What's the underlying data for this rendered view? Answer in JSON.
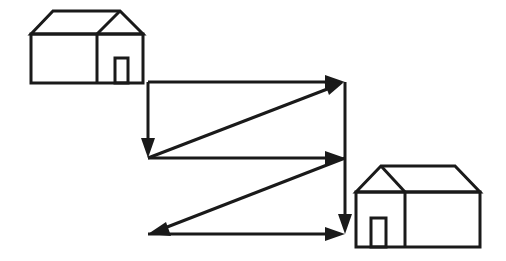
{
  "diagram": {
    "type": "path-between-houses",
    "colors": {
      "line": "#1a1a1a",
      "background": "#ffffff"
    },
    "houses": [
      {
        "name": "start-house",
        "position": "top-left",
        "door_side": "right"
      },
      {
        "name": "end-house",
        "position": "bottom-right",
        "door_side": "left"
      }
    ],
    "path": [
      {
        "from": [
          148,
          82
        ],
        "to": [
          148,
          158
        ],
        "direction": "down"
      },
      {
        "from": [
          148,
          158
        ],
        "to": [
          345,
          82
        ],
        "direction": "up-right"
      },
      {
        "from": [
          148,
          82
        ],
        "to": [
          345,
          82
        ],
        "direction": "right"
      },
      {
        "from": [
          148,
          158
        ],
        "to": [
          345,
          158
        ],
        "direction": "right"
      },
      {
        "from": [
          345,
          158
        ],
        "to": [
          148,
          234
        ],
        "direction": "down-left"
      },
      {
        "from": [
          148,
          234
        ],
        "to": [
          345,
          234
        ],
        "direction": "right"
      },
      {
        "from": [
          345,
          82
        ],
        "to": [
          345,
          234
        ],
        "direction": "down"
      }
    ]
  }
}
